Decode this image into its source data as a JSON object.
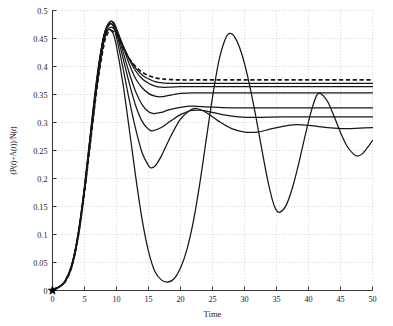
{
  "chart_data": {
    "type": "line",
    "title": "",
    "xlabel": "Time",
    "ylabel": "(P(t)+A(t))/N(t)",
    "ylabel_parts": [
      {
        "text": "(P(",
        "italic": false
      },
      {
        "text": "t",
        "italic": true
      },
      {
        "text": ")+A(",
        "italic": false
      },
      {
        "text": "t",
        "italic": true
      },
      {
        "text": "))/N(",
        "italic": false
      },
      {
        "text": "t",
        "italic": true
      },
      {
        "text": ")",
        "italic": false
      }
    ],
    "xlim": [
      0,
      50
    ],
    "ylim": [
      0,
      0.5
    ],
    "xticks": [
      0,
      5,
      10,
      15,
      20,
      25,
      30,
      35,
      40,
      45,
      50
    ],
    "xtick_labels": [
      "0",
      "5",
      "10",
      "15",
      "20",
      "25",
      "30",
      "35",
      "40",
      "45",
      "50"
    ],
    "yticks": [
      0,
      0.05,
      0.1,
      0.15,
      0.2,
      0.25,
      0.3,
      0.35,
      0.4,
      0.45,
      0.5
    ],
    "ytick_labels": [
      "0",
      "0.05",
      "0.1",
      "0.15",
      "0.2",
      "0.25",
      "0.3",
      "0.35",
      "0.4",
      "0.45",
      "0.5"
    ],
    "grid": true,
    "grid_style": "dotted",
    "grid_color": "#bdbdbd",
    "legend": "none",
    "line_color": "#171717",
    "markers": [
      {
        "name": "origin-star",
        "x": 0,
        "y": 0,
        "symbol": "star",
        "color": "#000000",
        "size": 9
      }
    ],
    "series": [
      {
        "name": "curve-1-dashed-steady",
        "style": "dashed",
        "steady_state": 0.376,
        "points": [
          [
            0,
            0.002
          ],
          [
            1,
            0.006
          ],
          [
            2,
            0.016
          ],
          [
            3,
            0.042
          ],
          [
            4,
            0.095
          ],
          [
            5,
            0.176
          ],
          [
            6,
            0.272
          ],
          [
            7,
            0.366
          ],
          [
            8,
            0.437
          ],
          [
            8.6,
            0.459
          ],
          [
            9.2,
            0.464
          ],
          [
            10,
            0.456
          ],
          [
            11,
            0.434
          ],
          [
            12,
            0.414
          ],
          [
            13,
            0.4
          ],
          [
            14,
            0.39
          ],
          [
            15,
            0.384
          ],
          [
            16,
            0.38
          ],
          [
            17,
            0.378
          ],
          [
            18,
            0.377
          ],
          [
            20,
            0.376
          ],
          [
            24,
            0.376
          ],
          [
            30,
            0.376
          ],
          [
            40,
            0.376
          ],
          [
            50,
            0.376
          ]
        ]
      },
      {
        "name": "curve-2-steady-0370",
        "style": "solid",
        "steady_state": 0.37,
        "points": [
          [
            0,
            0.002
          ],
          [
            1,
            0.006
          ],
          [
            2,
            0.016
          ],
          [
            3,
            0.042
          ],
          [
            4,
            0.095
          ],
          [
            5,
            0.177
          ],
          [
            6,
            0.274
          ],
          [
            7,
            0.369
          ],
          [
            8,
            0.442
          ],
          [
            8.7,
            0.466
          ],
          [
            9.3,
            0.47
          ],
          [
            10,
            0.461
          ],
          [
            11,
            0.437
          ],
          [
            12,
            0.414
          ],
          [
            13,
            0.397
          ],
          [
            14,
            0.385
          ],
          [
            15,
            0.378
          ],
          [
            16,
            0.373
          ],
          [
            17,
            0.371
          ],
          [
            18,
            0.37
          ],
          [
            20,
            0.37
          ],
          [
            26,
            0.37
          ],
          [
            34,
            0.37
          ],
          [
            42,
            0.37
          ],
          [
            50,
            0.37
          ]
        ]
      },
      {
        "name": "curve-3-steady-0364",
        "style": "solid",
        "steady_state": 0.364,
        "points": [
          [
            0,
            0.002
          ],
          [
            1,
            0.006
          ],
          [
            2,
            0.016
          ],
          [
            3,
            0.043
          ],
          [
            4,
            0.096
          ],
          [
            5,
            0.178
          ],
          [
            6,
            0.276
          ],
          [
            7,
            0.372
          ],
          [
            8,
            0.447
          ],
          [
            8.7,
            0.472
          ],
          [
            9.3,
            0.476
          ],
          [
            10,
            0.465
          ],
          [
            11,
            0.438
          ],
          [
            12,
            0.412
          ],
          [
            13,
            0.392
          ],
          [
            14,
            0.378
          ],
          [
            15,
            0.37
          ],
          [
            16,
            0.365
          ],
          [
            17,
            0.363
          ],
          [
            18,
            0.363
          ],
          [
            20,
            0.364
          ],
          [
            26,
            0.364
          ],
          [
            34,
            0.364
          ],
          [
            42,
            0.364
          ],
          [
            50,
            0.364
          ]
        ]
      },
      {
        "name": "curve-4-steady-0353",
        "style": "solid",
        "steady_state": 0.353,
        "points": [
          [
            0,
            0.002
          ],
          [
            1,
            0.006
          ],
          [
            2,
            0.017
          ],
          [
            3,
            0.044
          ],
          [
            4,
            0.098
          ],
          [
            5,
            0.18
          ],
          [
            6,
            0.28
          ],
          [
            7,
            0.377
          ],
          [
            8,
            0.452
          ],
          [
            8.8,
            0.477
          ],
          [
            9.4,
            0.48
          ],
          [
            10,
            0.468
          ],
          [
            11,
            0.436
          ],
          [
            12,
            0.404
          ],
          [
            13,
            0.378
          ],
          [
            14,
            0.362
          ],
          [
            15,
            0.352
          ],
          [
            16,
            0.347
          ],
          [
            17,
            0.346
          ],
          [
            18,
            0.348
          ],
          [
            19,
            0.35
          ],
          [
            20,
            0.352
          ],
          [
            22,
            0.353
          ],
          [
            26,
            0.353
          ],
          [
            34,
            0.353
          ],
          [
            42,
            0.353
          ],
          [
            50,
            0.353
          ]
        ]
      },
      {
        "name": "curve-5-steady-0326",
        "style": "solid",
        "steady_state": 0.326,
        "points": [
          [
            0,
            0.002
          ],
          [
            1,
            0.006
          ],
          [
            2,
            0.017
          ],
          [
            3,
            0.044
          ],
          [
            4,
            0.098
          ],
          [
            5,
            0.181
          ],
          [
            6,
            0.281
          ],
          [
            7,
            0.378
          ],
          [
            8,
            0.452
          ],
          [
            8.8,
            0.477
          ],
          [
            9.5,
            0.479
          ],
          [
            10,
            0.465
          ],
          [
            11,
            0.427
          ],
          [
            12,
            0.388
          ],
          [
            13,
            0.355
          ],
          [
            14,
            0.332
          ],
          [
            15,
            0.319
          ],
          [
            15.8,
            0.316
          ],
          [
            17,
            0.318
          ],
          [
            18,
            0.322
          ],
          [
            19.5,
            0.326
          ],
          [
            21,
            0.329
          ],
          [
            22.5,
            0.329
          ],
          [
            24,
            0.328
          ],
          [
            26,
            0.327
          ],
          [
            29,
            0.326
          ],
          [
            34,
            0.326
          ],
          [
            42,
            0.326
          ],
          [
            50,
            0.326
          ]
        ]
      },
      {
        "name": "curve-6-steady-0310",
        "style": "solid",
        "steady_state": 0.31,
        "points": [
          [
            0,
            0.002
          ],
          [
            1,
            0.006
          ],
          [
            2,
            0.017
          ],
          [
            3,
            0.045
          ],
          [
            4,
            0.099
          ],
          [
            5,
            0.182
          ],
          [
            6,
            0.283
          ],
          [
            7,
            0.38
          ],
          [
            8,
            0.454
          ],
          [
            8.8,
            0.478
          ],
          [
            9.5,
            0.478
          ],
          [
            10,
            0.461
          ],
          [
            11,
            0.416
          ],
          [
            12,
            0.37
          ],
          [
            13,
            0.33
          ],
          [
            14,
            0.302
          ],
          [
            15,
            0.288
          ],
          [
            15.6,
            0.285
          ],
          [
            17,
            0.291
          ],
          [
            18.5,
            0.303
          ],
          [
            20,
            0.314
          ],
          [
            21.5,
            0.321
          ],
          [
            23,
            0.322
          ],
          [
            25,
            0.318
          ],
          [
            27,
            0.313
          ],
          [
            29,
            0.31
          ],
          [
            32,
            0.309
          ],
          [
            36,
            0.31
          ],
          [
            42,
            0.31
          ],
          [
            50,
            0.31
          ]
        ]
      },
      {
        "name": "curve-7-damped-0291",
        "style": "solid",
        "steady_state": 0.291,
        "points": [
          [
            0,
            0.002
          ],
          [
            1,
            0.006
          ],
          [
            2,
            0.017
          ],
          [
            3,
            0.045
          ],
          [
            4,
            0.1
          ],
          [
            5,
            0.184
          ],
          [
            6,
            0.285
          ],
          [
            7,
            0.382
          ],
          [
            8,
            0.454
          ],
          [
            8.9,
            0.475
          ],
          [
            9.5,
            0.472
          ],
          [
            10,
            0.452
          ],
          [
            11,
            0.398
          ],
          [
            12,
            0.34
          ],
          [
            13,
            0.288
          ],
          [
            14,
            0.246
          ],
          [
            15,
            0.223
          ],
          [
            15.4,
            0.219
          ],
          [
            16,
            0.222
          ],
          [
            17,
            0.24
          ],
          [
            18.5,
            0.276
          ],
          [
            20,
            0.306
          ],
          [
            21.5,
            0.322
          ],
          [
            22.5,
            0.325
          ],
          [
            24,
            0.318
          ],
          [
            26,
            0.302
          ],
          [
            28,
            0.289
          ],
          [
            30,
            0.283
          ],
          [
            32,
            0.283
          ],
          [
            34,
            0.288
          ],
          [
            36,
            0.293
          ],
          [
            38,
            0.296
          ],
          [
            40,
            0.295
          ],
          [
            42,
            0.292
          ],
          [
            44,
            0.29
          ],
          [
            46,
            0.289
          ],
          [
            48,
            0.29
          ],
          [
            50,
            0.291
          ]
        ]
      },
      {
        "name": "curve-8-sustained-oscillation",
        "style": "solid",
        "steady_state": null,
        "points": [
          [
            0,
            0.002
          ],
          [
            1,
            0.006
          ],
          [
            2,
            0.018
          ],
          [
            3,
            0.046
          ],
          [
            4,
            0.102
          ],
          [
            5,
            0.187
          ],
          [
            6,
            0.289
          ],
          [
            7,
            0.386
          ],
          [
            8,
            0.452
          ],
          [
            8.9,
            0.466
          ],
          [
            9.5,
            0.458
          ],
          [
            10,
            0.436
          ],
          [
            11,
            0.37
          ],
          [
            12,
            0.288
          ],
          [
            13,
            0.203
          ],
          [
            14,
            0.127
          ],
          [
            15,
            0.07
          ],
          [
            16,
            0.034
          ],
          [
            17,
            0.019
          ],
          [
            18,
            0.015
          ],
          [
            19,
            0.021
          ],
          [
            20,
            0.04
          ],
          [
            21,
            0.073
          ],
          [
            22,
            0.123
          ],
          [
            23,
            0.19
          ],
          [
            24,
            0.268
          ],
          [
            25,
            0.345
          ],
          [
            26,
            0.41
          ],
          [
            27,
            0.449
          ],
          [
            27.7,
            0.459
          ],
          [
            28.5,
            0.452
          ],
          [
            29.5,
            0.425
          ],
          [
            30.5,
            0.382
          ],
          [
            31.5,
            0.327
          ],
          [
            32.5,
            0.265
          ],
          [
            33.5,
            0.204
          ],
          [
            34.4,
            0.16
          ],
          [
            35,
            0.143
          ],
          [
            35.6,
            0.14
          ],
          [
            36.5,
            0.152
          ],
          [
            37.5,
            0.184
          ],
          [
            38.5,
            0.228
          ],
          [
            39.5,
            0.278
          ],
          [
            40.5,
            0.323
          ],
          [
            41.3,
            0.349
          ],
          [
            42,
            0.351
          ],
          [
            43,
            0.337
          ],
          [
            44,
            0.311
          ],
          [
            45,
            0.282
          ],
          [
            46,
            0.258
          ],
          [
            47,
            0.244
          ],
          [
            47.6,
            0.24
          ],
          [
            48.4,
            0.244
          ],
          [
            49.2,
            0.255
          ],
          [
            50,
            0.268
          ]
        ]
      }
    ]
  },
  "axes": {
    "x_tick_count": 11,
    "y_tick_count": 11
  }
}
